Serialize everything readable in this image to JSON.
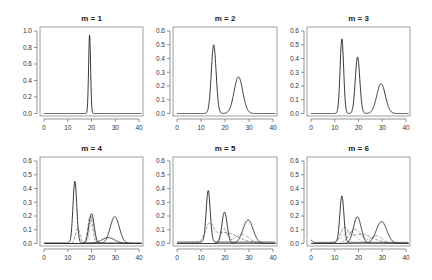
{
  "figure": {
    "layout": {
      "rows": 2,
      "cols": 3
    },
    "panels_geometry": [
      {
        "box": [
          40,
          27,
          143,
          116
        ]
      },
      {
        "box": [
          173,
          27,
          277,
          116
        ]
      },
      {
        "box": [
          307,
          27,
          410,
          116
        ]
      },
      {
        "box": [
          40,
          157,
          143,
          246
        ]
      },
      {
        "box": [
          173,
          157,
          277,
          246
        ]
      },
      {
        "box": [
          307,
          157,
          410,
          246
        ]
      }
    ]
  },
  "chart_data": [
    {
      "type": "line",
      "title": "m = 1",
      "xlabel": "",
      "ylabel": "",
      "xlim": [
        0,
        40
      ],
      "ylim": [
        0,
        1.0
      ],
      "xticks": [
        0,
        10,
        20,
        30,
        40
      ],
      "yticks": [
        0.0,
        0.2,
        0.4,
        0.6,
        0.8,
        1.0
      ],
      "ytick_labels": [
        "0.0",
        "0.2",
        "0.4",
        "0.6",
        "0.8",
        "1.0"
      ],
      "grid": false,
      "series": [
        {
          "name": "mixture density",
          "style": "solid",
          "components": [
            {
              "mean": 19.2,
              "sd": 0.42,
              "weight": 1.0
            }
          ]
        }
      ],
      "peaks": [
        {
          "x": 19.2,
          "y": 0.95
        }
      ]
    },
    {
      "type": "line",
      "title": "m = 2",
      "xlabel": "",
      "ylabel": "",
      "xlim": [
        0,
        40
      ],
      "ylim": [
        0,
        0.6
      ],
      "xticks": [
        0,
        10,
        20,
        30,
        40
      ],
      "yticks": [
        0.0,
        0.1,
        0.2,
        0.3,
        0.4,
        0.5,
        0.6
      ],
      "ytick_labels": [
        "0.0",
        "0.1",
        "0.2",
        "0.3",
        "0.4",
        "0.5",
        "0.6"
      ],
      "grid": false,
      "series": [
        {
          "name": "mixture density",
          "style": "solid",
          "components": [
            {
              "mean": 15.3,
              "sd": 1.0,
              "weight": 1.25
            },
            {
              "mean": 25.6,
              "sd": 1.8,
              "weight": 1.2
            }
          ]
        }
      ],
      "peaks": [
        {
          "x": 15.3,
          "y": 0.5
        },
        {
          "x": 25.6,
          "y": 0.265
        }
      ]
    },
    {
      "type": "line",
      "title": "m = 3",
      "xlabel": "",
      "ylabel": "",
      "xlim": [
        0,
        40
      ],
      "ylim": [
        0,
        0.6
      ],
      "xticks": [
        0,
        10,
        20,
        30,
        40
      ],
      "yticks": [
        0.0,
        0.1,
        0.2,
        0.3,
        0.4,
        0.5,
        0.6
      ],
      "ytick_labels": [
        "0.0",
        "0.1",
        "0.2",
        "0.3",
        "0.4",
        "0.5",
        "0.6"
      ],
      "grid": false,
      "series": [
        {
          "name": "mixture density",
          "style": "solid",
          "components": [
            {
              "mean": 13.0,
              "sd": 0.75,
              "weight": 1.02
            },
            {
              "mean": 19.6,
              "sd": 0.95,
              "weight": 0.98
            },
            {
              "mean": 29.5,
              "sd": 1.8,
              "weight": 0.98
            }
          ]
        }
      ],
      "peaks": [
        {
          "x": 13.0,
          "y": 0.54
        },
        {
          "x": 19.6,
          "y": 0.41
        },
        {
          "x": 29.5,
          "y": 0.215
        }
      ]
    },
    {
      "type": "line",
      "title": "m = 4",
      "xlabel": "",
      "ylabel": "",
      "xlim": [
        0,
        40
      ],
      "ylim": [
        0,
        0.6
      ],
      "xticks": [
        0,
        10,
        20,
        30,
        40
      ],
      "yticks": [
        0.0,
        0.1,
        0.2,
        0.3,
        0.4,
        0.5,
        0.6
      ],
      "ytick_labels": [
        "0.0",
        "0.1",
        "0.2",
        "0.3",
        "0.4",
        "0.5",
        "0.6"
      ],
      "grid": false,
      "series": [
        {
          "name": "component 1",
          "style": "solid",
          "components": [
            {
              "mean": 13.0,
              "sd": 0.8,
              "weight": 0.9,
              "tail": 0.004
            }
          ]
        },
        {
          "name": "component 2",
          "style": "solid",
          "components": [
            {
              "mean": 20.0,
              "sd": 1.1,
              "weight": 0.6
            }
          ]
        },
        {
          "name": "component 3",
          "style": "solid",
          "components": [
            {
              "mean": 29.8,
              "sd": 1.9,
              "weight": 0.93
            }
          ]
        },
        {
          "name": "component 4",
          "style": "solid",
          "components": [
            {
              "mean": 27.0,
              "sd": 2.8,
              "weight": 0.3
            }
          ]
        },
        {
          "name": "component 2 (dashed)",
          "style": "dashed",
          "components": [
            {
              "mean": 14.2,
              "sd": 0.9,
              "weight": 0.25
            },
            {
              "mean": 19.5,
              "sd": 1.0,
              "weight": 0.5
            }
          ]
        },
        {
          "name": "component 2 (dotted)",
          "style": "dotted",
          "components": [
            {
              "mean": 20.2,
              "sd": 0.9,
              "weight": 0.45
            }
          ]
        }
      ],
      "peaks": [
        {
          "x": 13.0,
          "y": 0.45
        },
        {
          "x": 20.0,
          "y": 0.22
        },
        {
          "x": 29.8,
          "y": 0.195
        },
        {
          "x": 27.5,
          "y": 0.04
        }
      ]
    },
    {
      "type": "line",
      "title": "m = 5",
      "xlabel": "",
      "ylabel": "",
      "xlim": [
        0,
        40
      ],
      "ylim": [
        0,
        0.6
      ],
      "xticks": [
        0,
        10,
        20,
        30,
        40
      ],
      "yticks": [
        0.0,
        0.1,
        0.2,
        0.3,
        0.4,
        0.5,
        0.6
      ],
      "ytick_labels": [
        "0.0",
        "0.1",
        "0.2",
        "0.3",
        "0.4",
        "0.5",
        "0.6"
      ],
      "grid": false,
      "series": [
        {
          "name": "component 1",
          "style": "solid",
          "components": [
            {
              "mean": 13.0,
              "sd": 0.85,
              "weight": 0.8,
              "tail": 0.01
            }
          ]
        },
        {
          "name": "component 2",
          "style": "solid",
          "components": [
            {
              "mean": 19.8,
              "sd": 1.1,
              "weight": 0.63
            }
          ]
        },
        {
          "name": "component 3",
          "style": "solid",
          "components": [
            {
              "mean": 29.6,
              "sd": 2.1,
              "weight": 0.9
            }
          ]
        },
        {
          "name": "component 4",
          "style": "dashed",
          "components": [
            {
              "mean": 13.5,
              "sd": 1.6,
              "weight": 0.45
            },
            {
              "mean": 20.0,
              "sd": 5.5,
              "weight": 1.1
            }
          ]
        },
        {
          "name": "component 5",
          "style": "dotdash",
          "components": [
            {
              "mean": 19.5,
              "sd": 1.3,
              "weight": 0.35
            },
            {
              "mean": 27.0,
              "sd": 3.0,
              "weight": 0.5
            }
          ]
        }
      ],
      "peaks": [
        {
          "x": 13.0,
          "y": 0.38
        },
        {
          "x": 19.8,
          "y": 0.235
        },
        {
          "x": 29.6,
          "y": 0.175
        },
        {
          "x": 15.0,
          "y": 0.12
        },
        {
          "x": 27.0,
          "y": 0.08
        }
      ]
    },
    {
      "type": "line",
      "title": "m = 6",
      "xlabel": "",
      "ylabel": "",
      "xlim": [
        0,
        40
      ],
      "ylim": [
        0,
        0.6
      ],
      "xticks": [
        0,
        10,
        20,
        30,
        40
      ],
      "yticks": [
        0.0,
        0.1,
        0.2,
        0.3,
        0.4,
        0.5,
        0.6
      ],
      "ytick_labels": [
        "0.0",
        "0.1",
        "0.2",
        "0.3",
        "0.4",
        "0.5",
        "0.6"
      ],
      "grid": false,
      "series": [
        {
          "name": "component 1",
          "style": "solid",
          "components": [
            {
              "mean": 13.0,
              "sd": 0.85,
              "weight": 0.72,
              "tail": 0.008
            },
            {
              "mean": 0.2,
              "sd": 0.4,
              "weight": 0.015
            }
          ]
        },
        {
          "name": "component 2",
          "style": "solid",
          "components": [
            {
              "mean": 19.5,
              "sd": 1.6,
              "weight": 0.78
            }
          ]
        },
        {
          "name": "component 3",
          "style": "solid",
          "components": [
            {
              "mean": 29.7,
              "sd": 2.2,
              "weight": 0.88
            }
          ]
        },
        {
          "name": "component 4",
          "style": "dashed",
          "components": [
            {
              "mean": 14.0,
              "sd": 1.5,
              "weight": 0.35
            },
            {
              "mean": 21.0,
              "sd": 5.0,
              "weight": 0.85
            }
          ]
        },
        {
          "name": "component 5",
          "style": "dotdash",
          "components": [
            {
              "mean": 18.5,
              "sd": 2.5,
              "weight": 0.65
            },
            {
              "mean": 27.5,
              "sd": 2.5,
              "weight": 0.35
            }
          ]
        },
        {
          "name": "component 6",
          "style": "dotted",
          "components": [
            {
              "mean": 16.0,
              "sd": 3.0,
              "weight": 0.6
            }
          ]
        }
      ],
      "peaks": [
        {
          "x": 13.0,
          "y": 0.34
        },
        {
          "x": 19.5,
          "y": 0.195
        },
        {
          "x": 29.7,
          "y": 0.16
        },
        {
          "x": 27.0,
          "y": 0.08
        }
      ]
    }
  ]
}
